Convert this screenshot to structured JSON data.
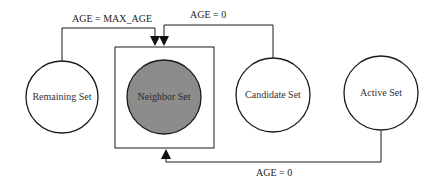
{
  "diagram": {
    "nodes": [
      {
        "id": "remaining",
        "label": "Remaining Set",
        "fill": "#ffffff"
      },
      {
        "id": "neighbor",
        "label": "Neighbor Set",
        "fill": "#8c8c8c",
        "boxed": true
      },
      {
        "id": "candidate",
        "label": "Candidate Set",
        "fill": "#ffffff"
      },
      {
        "id": "active",
        "label": "Active Set",
        "fill": "#ffffff"
      }
    ],
    "edges": [
      {
        "from": "remaining",
        "to": "neighbor",
        "label": "AGE = MAX_AGE"
      },
      {
        "from": "candidate",
        "to": "neighbor",
        "label": "AGE = 0"
      },
      {
        "from": "active",
        "to": "neighbor",
        "label": "AGE = 0"
      }
    ],
    "colors": {
      "stroke": "#1a1a1a",
      "neighbor_fill": "#8c8c8c",
      "background": "#ffffff"
    }
  }
}
